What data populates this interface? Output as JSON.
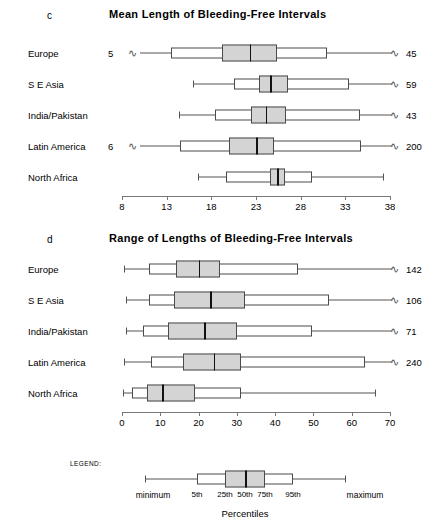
{
  "chart_data": [
    {
      "type": "box",
      "panel_letter": "c",
      "title": "Mean Length of Bleeding-Free Intervals",
      "xlabel": "",
      "ylabel": "",
      "xlim": [
        8,
        38
      ],
      "xticks": [
        8,
        13,
        18,
        23,
        28,
        33,
        38
      ],
      "grid": false,
      "box_definition": {
        "whiskers": "minimum to maximum",
        "outer_box": "5th to 95th percentile",
        "inner_box": "25th to 75th percentile",
        "center_line": "50th percentile (median)"
      },
      "categories": [
        "Europe",
        "S E Asia",
        "India/Pakistan",
        "Latin America",
        "North Africa"
      ],
      "boxes": [
        {
          "category": "Europe",
          "min": 5,
          "p5": 13.5,
          "p25": 19.2,
          "p50": 22.3,
          "p75": 25.3,
          "p95": 31.0,
          "max": 45,
          "left_break": true,
          "right_break": true,
          "left_label": "5",
          "right_label": "45"
        },
        {
          "category": "S E Asia",
          "min": 16.0,
          "p5": 20.5,
          "p25": 23.3,
          "p50": 24.6,
          "p75": 26.6,
          "p95": 33.4,
          "max": 59,
          "left_break": false,
          "right_break": true,
          "left_label": "",
          "right_label": "59"
        },
        {
          "category": "India/Pakistan",
          "min": 14.4,
          "p5": 18.4,
          "p25": 22.4,
          "p50": 24.1,
          "p75": 26.4,
          "p95": 34.6,
          "max": 43,
          "left_break": false,
          "right_break": true,
          "left_label": "",
          "right_label": "43"
        },
        {
          "category": "Latin America",
          "min": 6,
          "p5": 14.5,
          "p25": 20.0,
          "p50": 23.0,
          "p75": 25.0,
          "p95": 34.7,
          "max": 200,
          "left_break": true,
          "right_break": true,
          "left_label": "6",
          "right_label": "200"
        },
        {
          "category": "North Africa",
          "min": 16.5,
          "p5": 19.6,
          "p25": 24.6,
          "p50": 25.4,
          "p75": 26.3,
          "p95": 29.3,
          "max": 37.2,
          "left_break": false,
          "right_break": false,
          "left_label": "",
          "right_label": ""
        }
      ]
    },
    {
      "type": "box",
      "panel_letter": "d",
      "title": "Range of Lengths of Bleeding-Free Intervals",
      "xlabel": "",
      "ylabel": "",
      "xlim": [
        0,
        70
      ],
      "xticks": [
        0,
        10,
        20,
        30,
        40,
        50,
        60,
        70
      ],
      "grid": false,
      "box_definition": {
        "whiskers": "minimum to maximum",
        "outer_box": "5th to 95th percentile",
        "inner_box": "25th to 75th percentile",
        "center_line": "50th percentile (median)"
      },
      "categories": [
        "Europe",
        "S E Asia",
        "India/Pakistan",
        "Latin America",
        "North Africa"
      ],
      "boxes": [
        {
          "category": "Europe",
          "min": 0.5,
          "p5": 7.0,
          "p25": 14.0,
          "p50": 20.0,
          "p75": 25.5,
          "p95": 46.0,
          "max": 142,
          "left_break": false,
          "right_break": true,
          "left_label": "",
          "right_label": "142"
        },
        {
          "category": "S E Asia",
          "min": 1.0,
          "p5": 7.0,
          "p25": 13.5,
          "p50": 23.0,
          "p75": 32.0,
          "p95": 54.0,
          "max": 106,
          "left_break": false,
          "right_break": true,
          "left_label": "",
          "right_label": "106"
        },
        {
          "category": "India/Pakistan",
          "min": 1.0,
          "p5": 5.5,
          "p25": 12.0,
          "p50": 21.5,
          "p75": 30.0,
          "p95": 49.5,
          "max": 71,
          "left_break": false,
          "right_break": true,
          "left_label": "",
          "right_label": "71"
        },
        {
          "category": "Latin America",
          "min": 0.5,
          "p5": 7.5,
          "p25": 16.0,
          "p50": 24.0,
          "p75": 31.0,
          "p95": 63.5,
          "max": 240,
          "left_break": false,
          "right_break": true,
          "left_label": "",
          "right_label": "240"
        },
        {
          "category": "North Africa",
          "min": 0.3,
          "p5": 2.5,
          "p25": 6.5,
          "p50": 10.5,
          "p75": 19.0,
          "p95": 31.0,
          "max": 66.0,
          "left_break": false,
          "right_break": false,
          "left_label": "",
          "right_label": ""
        }
      ]
    }
  ],
  "legend": {
    "heading": "LEGEND:",
    "axis_label": "Percentiles",
    "min_label": "minimum",
    "max_label": "maximum",
    "percentile_labels": [
      "5th",
      "25th",
      "50th",
      "75th",
      "95th"
    ],
    "schematic": {
      "min": 0,
      "p5": 26,
      "p25": 40,
      "p50": 50,
      "p75": 60,
      "p95": 74,
      "max": 100
    }
  },
  "style": {
    "box_fill_inner": "#d4d4d4",
    "box_fill_outer": "#ffffff",
    "line_color": "#4a4a4a",
    "median_color": "#111111",
    "text_color": "#000000"
  }
}
